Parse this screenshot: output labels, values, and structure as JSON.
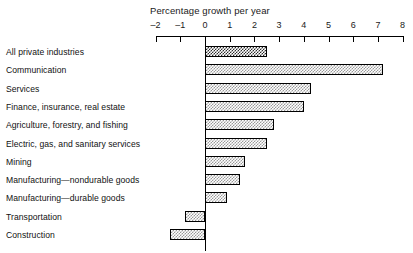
{
  "chart_data": {
    "type": "bar",
    "orientation": "horizontal",
    "title": "Percentage growth per year",
    "xlabel": "Percentage growth per year",
    "ylabel": "",
    "xlim": [
      -2,
      8
    ],
    "grid": false,
    "legend": null,
    "tick_labels": [
      "-2",
      "-1",
      "0",
      "1",
      "2",
      "3",
      "4",
      "5",
      "6",
      "7",
      "8"
    ],
    "tick_values": [
      -2,
      -1,
      0,
      1,
      2,
      3,
      4,
      5,
      6,
      7,
      8
    ],
    "categories": [
      "All private industries",
      "Communication",
      "Services",
      "Finance, insurance, real estate",
      "Agriculture, forestry, and fishing",
      "Electric, gas, and sanitary services",
      "Mining",
      "Manufacturing—nondurable goods",
      "Manufacturing—durable goods",
      "Transportation",
      "Construction"
    ],
    "values": [
      2.5,
      7.2,
      4.3,
      4.0,
      2.8,
      2.5,
      1.6,
      1.4,
      0.9,
      -0.8,
      -1.4
    ],
    "highlight_index": 0,
    "colors": {
      "highlight_fill": "#2b2b2b",
      "bar_fill": "#9a9a9a",
      "bar_border": "#000000",
      "axis": "#000000",
      "background": "#ffffff",
      "text": "#111111"
    }
  }
}
